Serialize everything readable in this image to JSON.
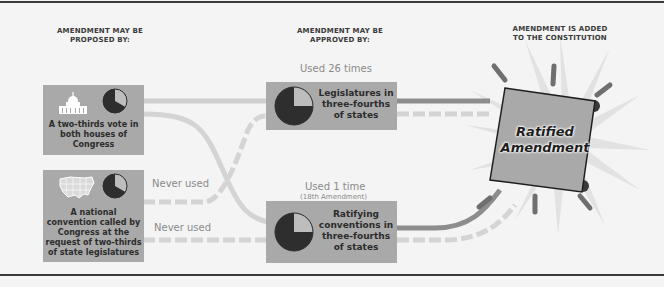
{
  "stages": {
    "proposed": "Amendment may be proposed by:",
    "approved": "Amendment may be approved by:",
    "added": "Amendment is added to the Constitution"
  },
  "proposal_methods": [
    {
      "id": "congress",
      "icon": "capitol-building-icon",
      "label": "A two-thirds vote in both houses of Congress",
      "pie_fraction": "2/3"
    },
    {
      "id": "convention",
      "icon": "us-map-icon",
      "label": "A national convention called by Congress at the request of two-thirds of state legislatures",
      "pie_fraction": "2/3"
    }
  ],
  "approval_methods": [
    {
      "id": "legislatures",
      "usage": "Used 26 times",
      "usage_note": "",
      "label": "Legislatures in three-fourths of states",
      "pie_fraction": "3/4"
    },
    {
      "id": "conventions",
      "usage": "Used 1 time",
      "usage_note": "(18th Amendment)",
      "label": "Ratifying conventions in three-fourths of states",
      "pie_fraction": "3/4"
    }
  ],
  "path_notes": {
    "convention_to_legislatures": "Never used",
    "convention_to_conventions": "Never used"
  },
  "result": {
    "label_line1": "Ratified",
    "label_line2": "Amendment"
  },
  "colors": {
    "background": "#f4f4f4",
    "box": "#a9a9a9",
    "solid_path": "#8d8d8d",
    "dashed_path": "#cfcfcf",
    "pie_dark": "#2e2e2e",
    "pie_light": "#bdbdbd",
    "rule": "#3a3a3a"
  }
}
